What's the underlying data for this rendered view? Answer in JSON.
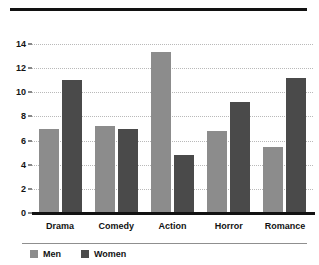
{
  "chart_data": {
    "type": "bar",
    "title": "",
    "xlabel": "",
    "ylabel": "",
    "categories": [
      "Drama",
      "Comedy",
      "Action",
      "Horror",
      "Romance"
    ],
    "series": [
      {
        "name": "Men",
        "color": "#8c8c8c",
        "values": [
          7.0,
          7.2,
          13.3,
          6.8,
          5.5
        ]
      },
      {
        "name": "Women",
        "color": "#4a4a4a",
        "values": [
          11.0,
          7.0,
          4.8,
          9.2,
          11.2
        ]
      }
    ],
    "ylim": [
      0,
      14
    ],
    "yticks": [
      0,
      2,
      4,
      6,
      8,
      10,
      12,
      14
    ],
    "ytick_labels": [
      "0",
      "2",
      "4",
      "6",
      "8",
      "10",
      "12",
      "14"
    ],
    "grid": true,
    "grid_axis": "y",
    "legend_position": "below"
  },
  "legend": {
    "items": [
      {
        "label": "Men"
      },
      {
        "label": "Women"
      }
    ]
  }
}
